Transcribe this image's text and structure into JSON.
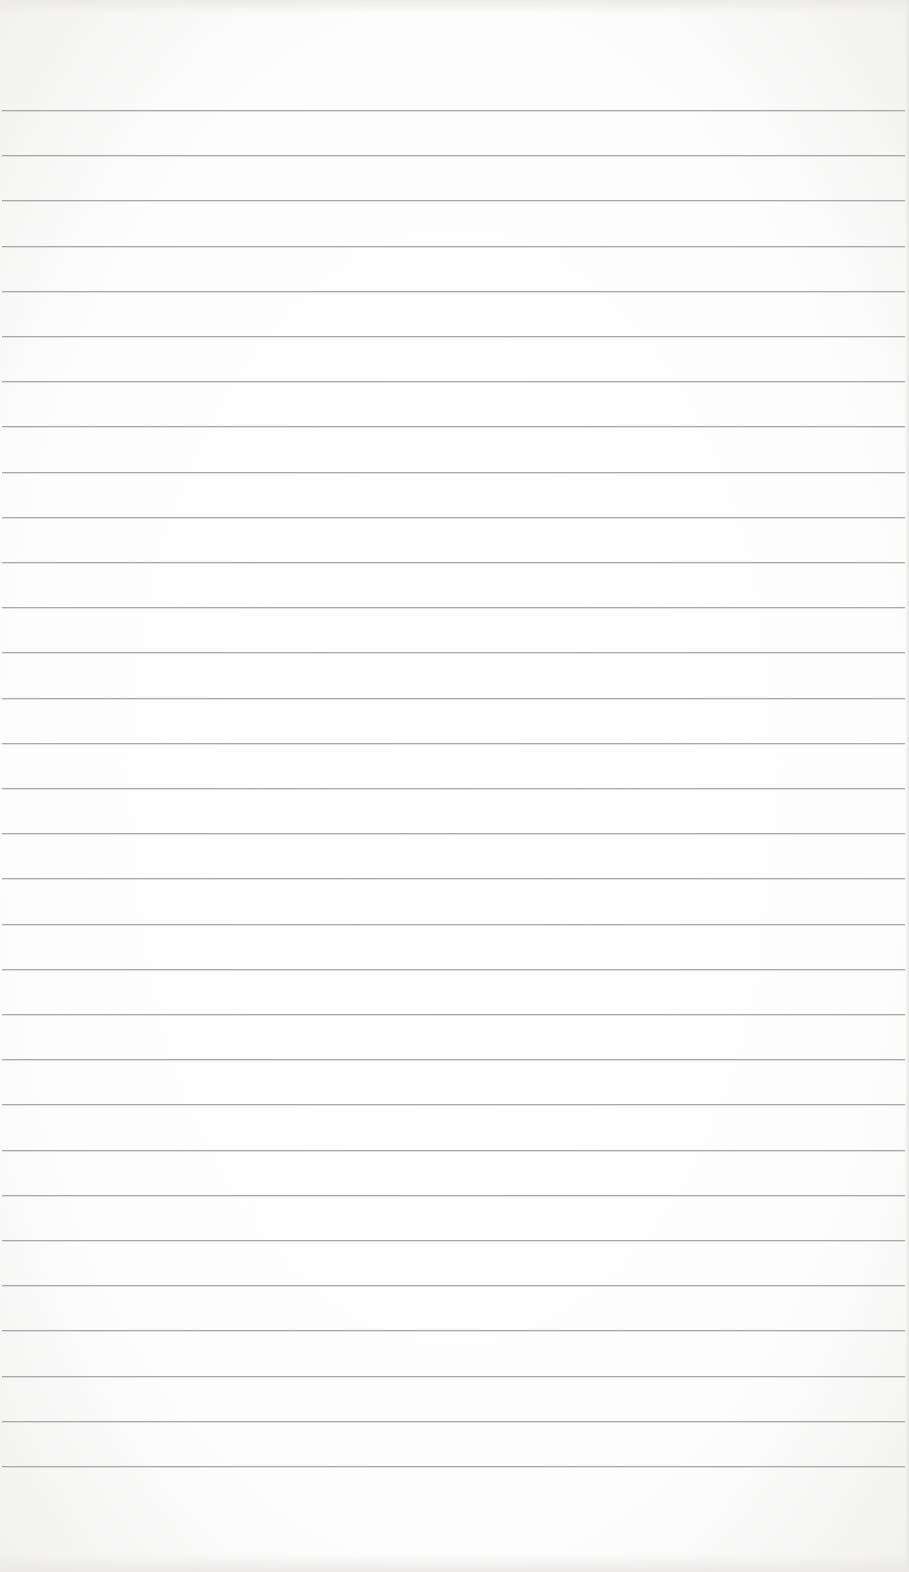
{
  "page": {
    "type": "lined-paper-sheet",
    "background_color": "#ffffff",
    "rule_color": "#a9a9a9",
    "rule_count": 31,
    "first_rule_y": 110,
    "rule_spacing": 45.2,
    "text": ""
  }
}
